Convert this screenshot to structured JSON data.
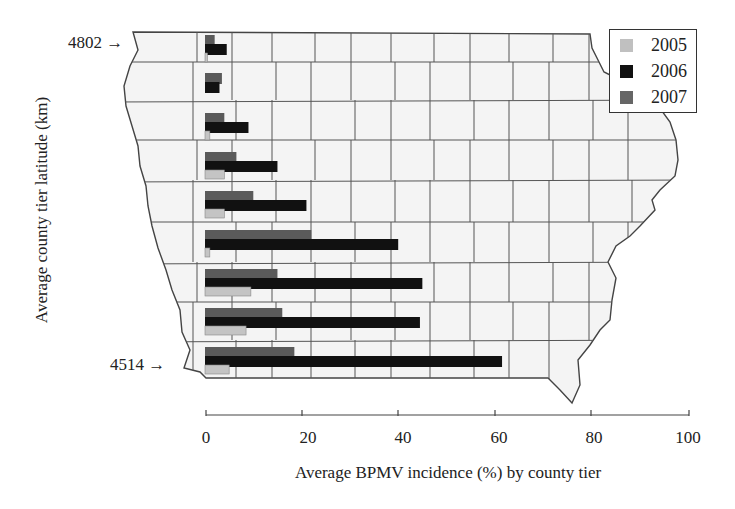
{
  "chart_data": {
    "type": "bar",
    "orientation": "horizontal",
    "title": "",
    "xlabel": "Average BPMV incidence (%) by county tier",
    "ylabel": "Average county tier latitude (km)",
    "xlim": [
      0,
      100
    ],
    "xticks": [
      0,
      20,
      40,
      60,
      80,
      100
    ],
    "y_annotations": [
      {
        "label": "4802",
        "position": "top tier"
      },
      {
        "label": "4514",
        "position": "bottom tier"
      }
    ],
    "categories": [
      "Tier 1 (4802)",
      "Tier 2",
      "Tier 3",
      "Tier 4",
      "Tier 5",
      "Tier 6",
      "Tier 7",
      "Tier 8",
      "Tier 9 (4514)"
    ],
    "series": [
      {
        "name": "2005",
        "color": "#b8b8b8",
        "values": [
          0.5,
          0,
          1,
          4,
          4,
          1,
          9.5,
          8.5,
          5
        ]
      },
      {
        "name": "2006",
        "color": "#111111",
        "values": [
          4.5,
          3,
          9,
          15,
          21,
          40,
          45,
          44.5,
          61.5
        ]
      },
      {
        "name": "2007",
        "color": "#555555",
        "values": [
          2,
          3.5,
          4,
          6.5,
          10,
          22,
          15,
          16,
          18.5
        ]
      }
    ],
    "legend_position": "upper right",
    "grid": false,
    "background": "Iowa county map outline"
  },
  "legend": {
    "items": [
      {
        "label": "2005",
        "color": "#b8b8b8"
      },
      {
        "label": "2006",
        "color": "#111111"
      },
      {
        "label": "2007",
        "color": "#555555"
      }
    ]
  },
  "axis": {
    "x_title": "Average BPMV incidence (%) by county tier",
    "y_title": "Average county tier latitude (km)",
    "x_ticks": [
      "0",
      "20",
      "40",
      "60",
      "80",
      "100"
    ],
    "y_top_label": "4802",
    "y_bottom_label": "4514"
  }
}
